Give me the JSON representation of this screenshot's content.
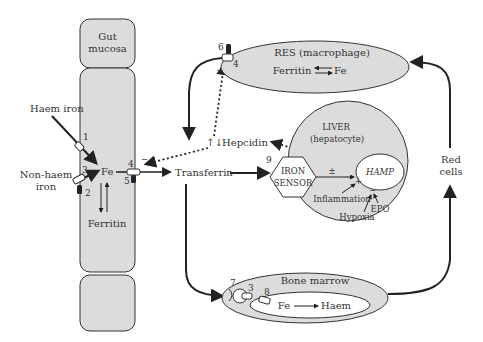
{
  "diagram": {
    "gut": {
      "title_line1": "Gut",
      "title_line2": "mucosa",
      "haem_iron": "Haem iron",
      "non_haem_line1": "Non-haem",
      "non_haem_line2": "iron",
      "fe": "Fe",
      "ferritin": "Ferritin",
      "markers": [
        "1",
        "2",
        "3",
        "4",
        "5"
      ]
    },
    "transferrin": "Transferrin",
    "hepcidin": {
      "arrows": "↑↓",
      "label": "Hepcidin"
    },
    "res": {
      "title": "RES (macrophage)",
      "ferritin": "Ferritin",
      "fe": "Fe",
      "markers": [
        "6",
        "4"
      ],
      "minus": "−"
    },
    "liver": {
      "title_line1": "LIVER",
      "title_line2": "(hepatocyte)",
      "sensor_line1": "IRON",
      "sensor_line2": "SENSOR",
      "sensor_marker": "9",
      "hamp": "HAMP",
      "plus_minus": "±",
      "inflammation": "Inflammation",
      "inflammation_sign": "+",
      "hypoxia": "Hypoxia",
      "epo": "EPO",
      "hypoxia_sign": "−"
    },
    "bone_marrow": {
      "title": "Bone marrow",
      "fe": "Fe",
      "haem": "Haem",
      "markers": [
        "7",
        "3",
        "8"
      ]
    },
    "red_cells": {
      "line1": "Red",
      "line2": "cells"
    },
    "gut_minus": "−",
    "colors": {
      "fill": "#dcdcdc",
      "stroke": "#333333",
      "text": "#333333",
      "dark_transporter": "#222222"
    }
  }
}
